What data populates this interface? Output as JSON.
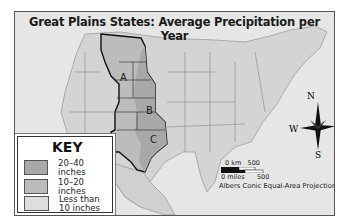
{
  "title": "Great Plains States: Average Precipitation per Year",
  "regions": [
    {
      "label": "A",
      "precipitation": "10–20 inches"
    },
    {
      "label": "B",
      "precipitation": "20–40 inches"
    },
    {
      "label": "C",
      "precipitation": "20–40 inches"
    }
  ],
  "key": {
    "title": "KEY",
    "items": [
      {
        "label": "20–40 inches",
        "color": "#a8a8a8"
      },
      {
        "label": "10–20 inches",
        "color": "#bcbcbc"
      },
      {
        "label_line1": "Less than",
        "label_line2": "10 inches",
        "color": "#dedede"
      }
    ]
  },
  "compass": {
    "n": "N",
    "s": "S",
    "e": "E",
    "w": "W"
  },
  "scale": {
    "km_label": "0 km",
    "km_value": "500",
    "miles_label": "0 miles",
    "miles_value": "500"
  },
  "projection": "Albers Conic Equal-Area Projection"
}
